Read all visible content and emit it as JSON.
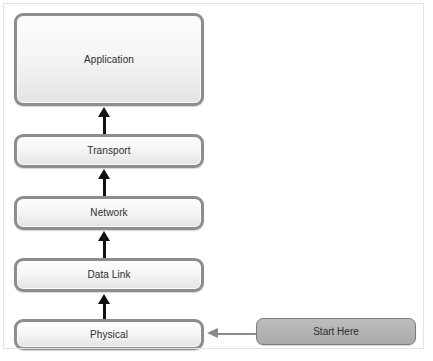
{
  "diagram": {
    "frame": {
      "border_color": "#b9b9b9",
      "background": "#ffffff"
    },
    "layer_box_style": {
      "border_color": "#8d8d8d",
      "fill_top": "#fdfdfd",
      "fill_bottom": "#e3e3e3",
      "text_color": "#2d2d2d"
    },
    "layers": [
      {
        "id": "application",
        "label": "Application"
      },
      {
        "id": "transport",
        "label": "Transport"
      },
      {
        "id": "network",
        "label": "Network"
      },
      {
        "id": "datalink",
        "label": "Data Link"
      },
      {
        "id": "physical",
        "label": "Physical"
      }
    ],
    "callout": {
      "id": "start-here",
      "label": "Start Here",
      "fill_color": "#b3b3b3",
      "border_color": "#7d7d7d",
      "text_color": "#2b2b2b"
    },
    "arrows": {
      "vertical": {
        "color": "#111111",
        "direction": "up",
        "count": 4,
        "from_to": [
          "physical-to-datalink",
          "datalink-to-network",
          "network-to-transport",
          "transport-to-application"
        ]
      },
      "horizontal": {
        "color": "#8a8a8a",
        "direction": "left",
        "from": "start-here",
        "to": "physical"
      }
    }
  }
}
